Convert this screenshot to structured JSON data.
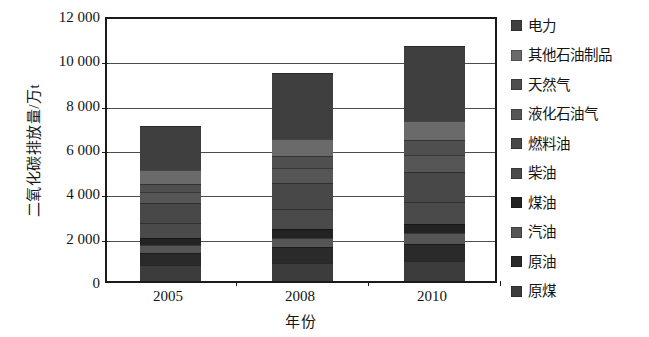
{
  "chart_data": {
    "type": "bar",
    "subtype": "stacked-bar",
    "title": "",
    "xlabel": "年份",
    "ylabel": "二氧化碳排放量/万t",
    "categories": [
      "2005",
      "2008",
      "2010"
    ],
    "ylim": [
      0,
      12000
    ],
    "ytick_labels": [
      "12 000",
      "10 000",
      "8 000",
      "6 000",
      "4 000",
      "2 000",
      "0"
    ],
    "ytick_values": [
      12000,
      10000,
      8000,
      6000,
      4000,
      2000,
      0
    ],
    "grid": true,
    "grid_axis": "y",
    "legend_position": "right",
    "totals": [
      7000,
      9400,
      10600
    ],
    "series": [
      {
        "name": "原煤",
        "color": "#3c3c3c",
        "values": [
          700,
          820,
          900
        ]
      },
      {
        "name": "原油",
        "color": "#2a2a2a",
        "values": [
          560,
          700,
          780
        ]
      },
      {
        "name": "汽油",
        "color": "#555555",
        "values": [
          360,
          430,
          480
        ]
      },
      {
        "name": "煤油",
        "color": "#232323",
        "values": [
          300,
          380,
          420
        ]
      },
      {
        "name": "柴油",
        "color": "#4a4a4a",
        "values": [
          680,
          900,
          1000
        ]
      },
      {
        "name": "燃料油",
        "color": "#484848",
        "values": [
          900,
          1200,
          1350
        ]
      },
      {
        "name": "液化石油气",
        "color": "#565656",
        "values": [
          500,
          670,
          770
        ]
      },
      {
        "name": "天然气",
        "color": "#4f4f4f",
        "values": [
          400,
          560,
          650
        ]
      },
      {
        "name": "其他石油制品",
        "color": "#6a6a6a",
        "values": [
          600,
          740,
          850
        ]
      },
      {
        "name": "电力",
        "color": "#3f3f3f",
        "values": [
          2000,
          3000,
          3400
        ]
      }
    ]
  },
  "axis": {
    "y_title": "二氧化碳排放量/万t",
    "x_title": "年份"
  },
  "legend": {
    "items": [
      {
        "label": "电力",
        "color": "#3f3f3f"
      },
      {
        "label": "其他石油制品",
        "color": "#6a6a6a"
      },
      {
        "label": "天然气",
        "color": "#4f4f4f"
      },
      {
        "label": "液化石油气",
        "color": "#565656"
      },
      {
        "label": "燃料油",
        "color": "#484848"
      },
      {
        "label": "柴油",
        "color": "#4a4a4a"
      },
      {
        "label": "煤油",
        "color": "#232323"
      },
      {
        "label": "汽油",
        "color": "#555555"
      },
      {
        "label": "原油",
        "color": "#2a2a2a"
      },
      {
        "label": "原煤",
        "color": "#3c3c3c"
      }
    ]
  }
}
